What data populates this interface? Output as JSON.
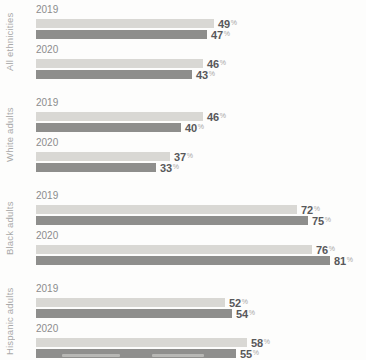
{
  "chart_data": {
    "type": "bar",
    "orientation": "horizontal",
    "value_unit": "%",
    "xlim": [
      0,
      100
    ],
    "grid": false,
    "legend": "cropped-out-of-frame",
    "categories": [
      "All ethnicities",
      "White adults",
      "Black adults",
      "Hispanic adults"
    ],
    "series": [
      {
        "name": "light-gray-series",
        "color": "#d9d8d4"
      },
      {
        "name": "dark-gray-series",
        "color": "#8e8e8c"
      }
    ],
    "groups": [
      {
        "category": "All ethnicities",
        "rows": [
          {
            "year": "2019",
            "values": [
              49,
              47
            ]
          },
          {
            "year": "2020",
            "values": [
              46,
              43
            ]
          }
        ]
      },
      {
        "category": "White adults",
        "rows": [
          {
            "year": "2019",
            "values": [
              46,
              40
            ]
          },
          {
            "year": "2020",
            "values": [
              37,
              33
            ]
          }
        ]
      },
      {
        "category": "Black adults",
        "rows": [
          {
            "year": "2019",
            "values": [
              72,
              75
            ]
          },
          {
            "year": "2020",
            "values": [
              76,
              81
            ]
          }
        ]
      },
      {
        "category": "Hispanic adults",
        "rows": [
          {
            "year": "2019",
            "values": [
              52,
              54
            ]
          },
          {
            "year": "2020",
            "values": [
              58,
              55
            ]
          }
        ]
      }
    ]
  },
  "colors": {
    "background": "#fdfdfc",
    "light_bar": "#d9d8d4",
    "dark_bar": "#8e8e8c",
    "year_label": "#8c8c8c",
    "category_label": "#a9a9a9",
    "value_number": "#58585a",
    "percent_sign": "#a5a5a5"
  }
}
